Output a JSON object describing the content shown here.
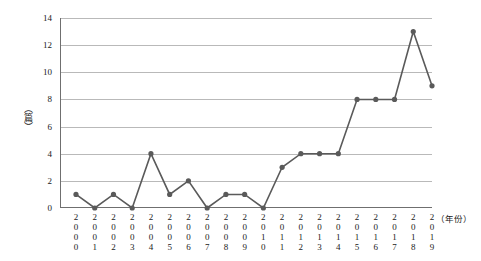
{
  "chart_data": {
    "type": "line",
    "title": "",
    "xlabel": "（年份）",
    "ylabel": "（篇）",
    "categories": [
      "2000",
      "2001",
      "2002",
      "2003",
      "2004",
      "2005",
      "2006",
      "2007",
      "2008",
      "2009",
      "2010",
      "2011",
      "2012",
      "2013",
      "2014",
      "2015",
      "2016",
      "2017",
      "2018",
      "2019"
    ],
    "values": [
      1,
      0,
      1,
      0,
      4,
      1,
      2,
      0,
      1,
      1,
      0,
      3,
      4,
      4,
      4,
      8,
      8,
      8,
      13,
      9
    ],
    "yticks": [
      "0",
      "2",
      "4",
      "6",
      "8",
      "10",
      "12",
      "14"
    ],
    "ylim": [
      0,
      14
    ],
    "grid": true,
    "legend": "none",
    "series_color": "#5a5a5a",
    "marker": "circle"
  }
}
